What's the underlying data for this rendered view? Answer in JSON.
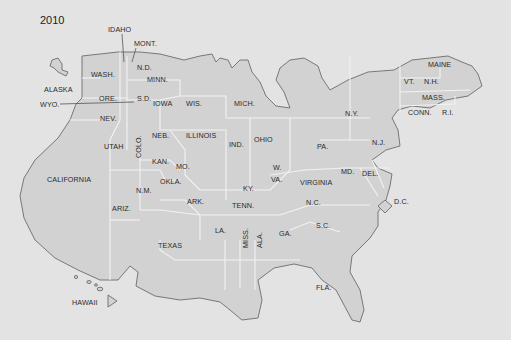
{
  "map": {
    "year": "2010",
    "type": "cartogram",
    "colors": {
      "background": "#e3e3e3",
      "land": "#d2d2d2",
      "coast": "#6c6c6c",
      "state_border": "#f2f2f2",
      "text": "#2a2a2a"
    },
    "labels": {
      "idaho": "IDAHO",
      "mont": "MONT.",
      "alaska": "ALASKA",
      "wyo": "WYO.",
      "wash": "WASH.",
      "ore": "ORE.",
      "nd": "N.D.",
      "minn": "MINN.",
      "sd": "S.D.",
      "iowa": "IOWA",
      "wis": "WIS.",
      "mich": "MICH.",
      "nev": "NEV.",
      "utah": "UTAH",
      "colo": "COLO.",
      "neb": "NEB.",
      "illinois": "ILLINOIS",
      "ind": "IND.",
      "ohio": "OHIO",
      "kan": "KAN.",
      "mo": "MO.",
      "okla": "OKLA.",
      "nm": "N.M.",
      "california": "CALIFORNIA",
      "ariz": "ARIZ.",
      "texas": "TEXAS",
      "ark": "ARK.",
      "ky": "KY.",
      "tenn": "TENN.",
      "wva_w": "W.",
      "wva_va": "VA.",
      "virginia": "VIRGINIA",
      "md": "MD.",
      "del": "DEL.",
      "nc": "N.C.",
      "sc": "S.C.",
      "la": "LA.",
      "miss": "MISS.",
      "ala": "ALA.",
      "ga": "GA.",
      "fla": "FLA.",
      "pa": "PA.",
      "nj": "N.J.",
      "ny": "N.Y.",
      "vt": "VT.",
      "nh": "N.H.",
      "maine": "MAINE",
      "mass": "MASS.",
      "conn": "CONN.",
      "ri": "R.I.",
      "dc": "D.C.",
      "hawaii": "HAWAII"
    }
  }
}
